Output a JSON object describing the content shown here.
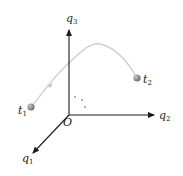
{
  "diagram": {
    "type": "3d-coordinate-trajectory",
    "axes": {
      "vertical": {
        "label": "q",
        "subscript": "3"
      },
      "horizontal": {
        "label": "q",
        "subscript": "2"
      },
      "diagonal": {
        "label": "q",
        "subscript": "1"
      }
    },
    "origin_label": "O",
    "points": [
      {
        "label": "t",
        "subscript": "1"
      },
      {
        "label": "t",
        "subscript": "2"
      }
    ],
    "colors": {
      "axis": "#1a1a1a",
      "curve": "#d0d0d0",
      "point": "#8a8a8a",
      "text": "#222222"
    }
  }
}
